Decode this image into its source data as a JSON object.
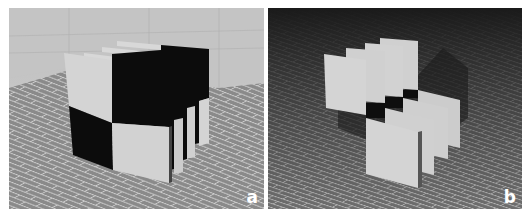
{
  "figure": {
    "panels": [
      {
        "id": "a",
        "label": "a",
        "description": "Stack of parallel panels whose front edges form a 2x2 black/white checkerboard, seen in a room with brick floor and light walls",
        "colors": {
          "wall": "#c9c9c9",
          "floor": "#8a8a8a",
          "grout": "#cfcfcf",
          "panel_light": "#d4d4d4",
          "panel_dark": "#0c0c0c"
        }
      },
      {
        "id": "b",
        "label": "b",
        "description": "Same panels separated into two staggered rows of four light plates over a brick floor with dark background",
        "colors": {
          "background": "#1e1e1e",
          "floor": "#6e6e6e",
          "grout": "#b8b8b8",
          "panel_light": "#cfcfcf",
          "shadow": "#1a1a1a"
        }
      }
    ]
  }
}
